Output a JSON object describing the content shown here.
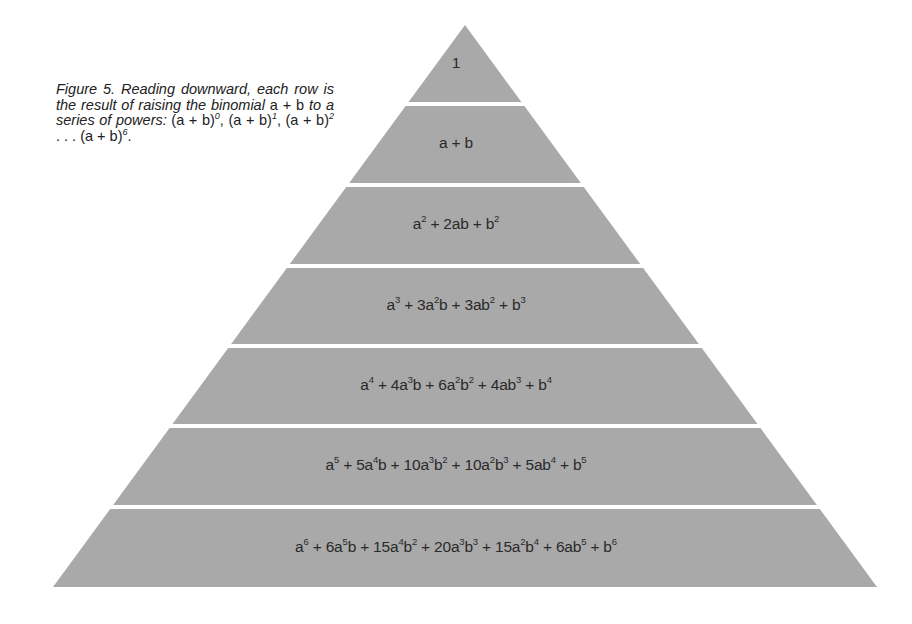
{
  "caption": {
    "text_parts": [
      {
        "t": "Figure 5. Reading downward, each row is the result of raising the binomial ",
        "style": "italic"
      },
      {
        "t": "a + b",
        "style": "upright"
      },
      {
        "t": " to a series of powers: ",
        "style": "italic"
      },
      {
        "t": "(a + b)",
        "style": "upright"
      },
      {
        "t": "0",
        "style": "sup"
      },
      {
        "t": ", (a + b)",
        "style": "upright"
      },
      {
        "t": "1",
        "style": "sup"
      },
      {
        "t": ", (a + b)",
        "style": "upright"
      },
      {
        "t": "2",
        "style": "sup"
      },
      {
        "t": " . . . (a + b)",
        "style": "upright"
      },
      {
        "t": "6",
        "style": "sup"
      },
      {
        "t": ".",
        "style": "upright"
      }
    ],
    "full_text": "Figure 5. Reading downward, each row is the result of raising the binomial a + b to a series of powers: (a + b)^0, (a + b)^1, (a + b)^2 . . . (a + b)^6."
  },
  "pyramid": {
    "fill_color": "#a9a9a9",
    "gap_color": "#ffffff",
    "apex": [
      465,
      25
    ],
    "base_y": 587,
    "base_left_x": 53,
    "base_right_x": 877,
    "rows": [
      {
        "power": 0,
        "expression": "1",
        "terms": [
          [
            "1",
            ""
          ]
        ]
      },
      {
        "power": 1,
        "expression": "a + b",
        "terms": [
          [
            "a",
            ""
          ],
          [
            " + b",
            ""
          ]
        ]
      },
      {
        "power": 2,
        "expression": "a^2 + 2ab + b^2",
        "terms": [
          [
            "a",
            "2"
          ],
          [
            " + 2ab + b",
            "2"
          ]
        ]
      },
      {
        "power": 3,
        "expression": "a^3 + 3a^2b + 3ab^2 + b^3",
        "terms": [
          [
            "a",
            "3"
          ],
          [
            " + 3a",
            "2"
          ],
          [
            "b + 3ab",
            "2"
          ],
          [
            " + b",
            "3"
          ]
        ]
      },
      {
        "power": 4,
        "expression": "a^4 + 4a^3b + 6a^2b^2 + 4ab^3 + b^4",
        "terms": [
          [
            "a",
            "4"
          ],
          [
            " + 4a",
            "3"
          ],
          [
            "b + 6a",
            "2"
          ],
          [
            "b",
            "2"
          ],
          [
            " + 4ab",
            "3"
          ],
          [
            " + b",
            "4"
          ]
        ]
      },
      {
        "power": 5,
        "expression": "a^5 + 5a^4b + 10a^3b^2 + 10a^2b^3 + 5ab^4 + b^5",
        "terms": [
          [
            "a",
            "5"
          ],
          [
            " + 5a",
            "4"
          ],
          [
            "b + 10a",
            "3"
          ],
          [
            "b",
            "2"
          ],
          [
            " + 10a",
            "2"
          ],
          [
            "b",
            "3"
          ],
          [
            " + 5ab",
            "4"
          ],
          [
            " + b",
            "5"
          ]
        ]
      },
      {
        "power": 6,
        "expression": "a^6 + 6a^5b + 15a^4b^2 + 20a^3b^3 + 15a^2b^4 + 6ab^5 + b^6",
        "terms": [
          [
            "a",
            "6"
          ],
          [
            " + 6a",
            "5"
          ],
          [
            "b + 15a",
            "4"
          ],
          [
            "b",
            "2"
          ],
          [
            " + 20a",
            "3"
          ],
          [
            "b",
            "3"
          ],
          [
            " + 15a",
            "2"
          ],
          [
            "b",
            "4"
          ],
          [
            " + 6ab",
            "5"
          ],
          [
            " + b",
            "6"
          ]
        ]
      }
    ],
    "band_bounds": [
      [
        25,
        102
      ],
      [
        106,
        183
      ],
      [
        187,
        264
      ],
      [
        268,
        344
      ],
      [
        348,
        424
      ],
      [
        428,
        505
      ],
      [
        509,
        587
      ]
    ],
    "label_y": [
      64,
      144,
      225,
      306,
      386,
      466,
      548
    ]
  }
}
